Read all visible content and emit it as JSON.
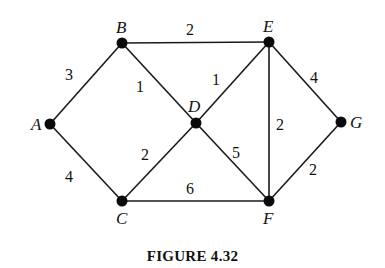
{
  "figure": {
    "caption": "FIGURE 4.32",
    "nodes": [
      {
        "id": "A",
        "label": "A",
        "x": 50,
        "y": 124,
        "lx": 31,
        "ly": 130
      },
      {
        "id": "B",
        "label": "B",
        "x": 122,
        "y": 43,
        "lx": 116,
        "ly": 33
      },
      {
        "id": "C",
        "label": "C",
        "x": 122,
        "y": 201,
        "lx": 116,
        "ly": 224
      },
      {
        "id": "D",
        "label": "D",
        "x": 196,
        "y": 123,
        "lx": 188,
        "ly": 112
      },
      {
        "id": "E",
        "label": "E",
        "x": 269,
        "y": 42,
        "lx": 263,
        "ly": 32
      },
      {
        "id": "F",
        "label": "F",
        "x": 269,
        "y": 201,
        "lx": 263,
        "ly": 224
      },
      {
        "id": "G",
        "label": "G",
        "x": 341,
        "y": 122,
        "lx": 350,
        "ly": 128
      }
    ],
    "edges": [
      {
        "from": "A",
        "to": "B",
        "weight": "3",
        "wx": 69,
        "wy": 80
      },
      {
        "from": "A",
        "to": "C",
        "weight": "4",
        "wx": 69,
        "wy": 182
      },
      {
        "from": "B",
        "to": "E",
        "weight": "2",
        "wx": 190,
        "wy": 35
      },
      {
        "from": "B",
        "to": "D",
        "weight": "1",
        "wx": 140,
        "wy": 92
      },
      {
        "from": "C",
        "to": "D",
        "weight": "2",
        "wx": 145,
        "wy": 160
      },
      {
        "from": "D",
        "to": "E",
        "weight": "1",
        "wx": 216,
        "wy": 85
      },
      {
        "from": "D",
        "to": "F",
        "weight": "5",
        "wx": 236,
        "wy": 158
      },
      {
        "from": "C",
        "to": "F",
        "weight": "6",
        "wx": 190,
        "wy": 194
      },
      {
        "from": "E",
        "to": "F",
        "weight": "2",
        "wx": 280,
        "wy": 130
      },
      {
        "from": "E",
        "to": "G",
        "weight": "4",
        "wx": 314,
        "wy": 83
      },
      {
        "from": "F",
        "to": "G",
        "weight": "2",
        "wx": 313,
        "wy": 175
      }
    ]
  }
}
